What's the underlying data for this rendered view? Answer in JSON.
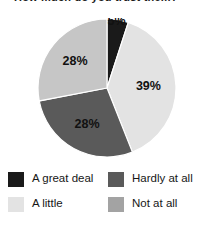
{
  "title": {
    "text": "How much do you trust them?",
    "cropped": true
  },
  "chart_data": {
    "type": "pie",
    "title": "How much do you trust them?",
    "xlabel": "",
    "ylabel": "",
    "legend_position": "bottom",
    "grid": false,
    "unit": "%",
    "categories": [
      "A great deal",
      "A little",
      "Hardly at all",
      "Not at all"
    ],
    "values": [
      5,
      39,
      28,
      28
    ],
    "labels": [
      "5%",
      "39%",
      "28%",
      "28%"
    ],
    "colors": [
      "#1a1a1a",
      "#e3e3e3",
      "#5a5a5a",
      "#c6c6c6"
    ],
    "start_angle_deg": 0,
    "direction": "clockwise",
    "slices": [
      {
        "name": "A great deal",
        "value": 5,
        "label": "5%",
        "color": "#1a1a1a",
        "label_color": "#ffffff",
        "label_clipped_top": true,
        "start_angle_deg": 0,
        "end_angle_deg": 18
      },
      {
        "name": "A little",
        "value": 39,
        "label": "39%",
        "color": "#e3e3e3",
        "label_color": "#111111",
        "label_clipped_top": false,
        "start_angle_deg": 18,
        "end_angle_deg": 158.4
      },
      {
        "name": "Hardly at all",
        "value": 28,
        "label": "28%",
        "color": "#5a5a5a",
        "label_color": "#111111",
        "label_clipped_top": false,
        "start_angle_deg": 158.4,
        "end_angle_deg": 259.2
      },
      {
        "name": "Not at all",
        "value": 28,
        "label": "28%",
        "color": "#c6c6c6",
        "label_color": "#111111",
        "label_clipped_top": false,
        "start_angle_deg": 259.2,
        "end_angle_deg": 360
      }
    ]
  },
  "legend": {
    "items": [
      {
        "label": "A great deal",
        "color": "#1a1a1a"
      },
      {
        "label": "Hardly at all",
        "color": "#5a5a5a"
      },
      {
        "label": "A little",
        "color": "#e3e3e3"
      },
      {
        "label": "Not at all",
        "color": "#a3a3a3"
      }
    ]
  }
}
